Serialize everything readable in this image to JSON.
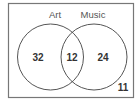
{
  "diagram": {
    "type": "venn",
    "sets": [
      {
        "label": "Art",
        "only_value": "32"
      },
      {
        "label": "Music",
        "only_value": "24"
      }
    ],
    "intersection_value": "12",
    "outside_value": "11",
    "colors": {
      "stroke": "#555555",
      "text": "#333333",
      "background": "#ffffff"
    }
  }
}
